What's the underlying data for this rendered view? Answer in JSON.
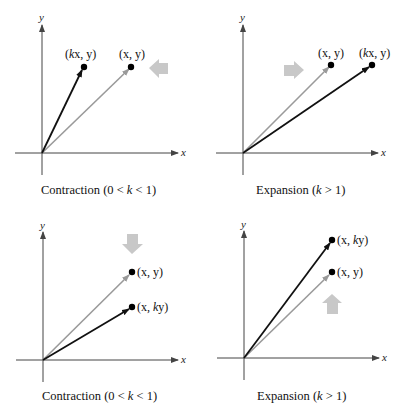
{
  "colors": {
    "axis": "#444444",
    "original_vector": "#9a9a9a",
    "transformed_vector": "#111111",
    "direction_arrow": "#c8c8c8",
    "point": "#000000"
  },
  "panels": [
    {
      "id": "horizontal-contraction",
      "x_axis_label": "x",
      "y_axis_label": "y",
      "original_point_label": "(x, y)",
      "transformed_point_label": "(kx, y)",
      "transformed_point_label_parts": [
        "(",
        "k",
        "x, y)"
      ],
      "direction": "left",
      "caption": "Contraction (0 < k < 1)",
      "caption_parts": [
        "Contraction (0 < ",
        "k",
        " < 1)"
      ]
    },
    {
      "id": "horizontal-expansion",
      "x_axis_label": "x",
      "y_axis_label": "y",
      "original_point_label": "(x, y)",
      "transformed_point_label": "(kx, y)",
      "transformed_point_label_parts": [
        "(",
        "k",
        "x, y)"
      ],
      "direction": "right",
      "caption": "Expansion (k > 1)",
      "caption_parts": [
        "Expansion (",
        "k",
        "  > 1)"
      ]
    },
    {
      "id": "vertical-contraction",
      "x_axis_label": "x",
      "y_axis_label": "y",
      "original_point_label": "(x, y)",
      "transformed_point_label": "(x, ky)",
      "transformed_point_label_parts": [
        "(x, ",
        "k",
        "y)"
      ],
      "direction": "down",
      "caption": "Contraction (0 < k < 1)",
      "caption_parts": [
        "Contraction (0 < ",
        "k",
        " < 1)"
      ]
    },
    {
      "id": "vertical-expansion",
      "x_axis_label": "x",
      "y_axis_label": "y",
      "original_point_label": "(x, y)",
      "transformed_point_label": "(x, ky)",
      "transformed_point_label_parts": [
        "(x, ",
        "k",
        "y)"
      ],
      "direction": "up",
      "caption": "Expansion (k > 1)",
      "caption_parts": [
        "Expansion (",
        "k",
        " > 1)"
      ]
    }
  ]
}
